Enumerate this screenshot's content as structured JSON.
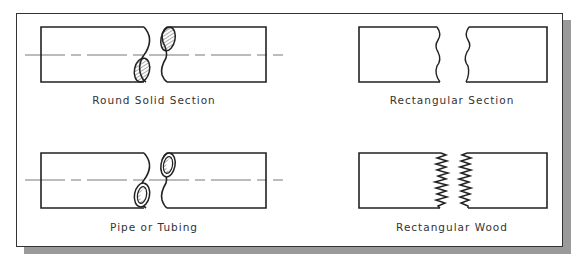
{
  "figure": {
    "panels": [
      {
        "id": "round-solid",
        "label": "Round Solid Section"
      },
      {
        "id": "rectangular",
        "label": "Rectangular Section"
      },
      {
        "id": "pipe",
        "label": "Pipe or Tubing"
      },
      {
        "id": "wood",
        "label": "Rectangular Wood"
      }
    ]
  },
  "colors": {
    "line": "#222222",
    "shadow": "#9a9a9a",
    "background": "#ffffff"
  }
}
